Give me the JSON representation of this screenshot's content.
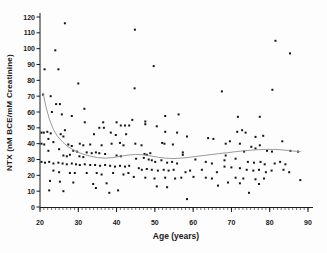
{
  "figure": {
    "background": "#fdfdfd",
    "point_color": "#141414",
    "curve_color": "#8f8f8f",
    "axis_color": "#1a1a1a",
    "tick_label_color": "#1a1a1a"
  },
  "chart_data": {
    "type": "scatter",
    "title": "",
    "xlabel": "Age (years)",
    "ylabel": "NTX (nM BCE/mM Creatinine)",
    "xlim": [
      20,
      90
    ],
    "ylim": [
      0,
      120
    ],
    "x_ticks": [
      20,
      30,
      40,
      50,
      60,
      70,
      80,
      90
    ],
    "y_ticks": [
      0,
      10,
      20,
      30,
      40,
      50,
      60,
      70,
      80,
      90,
      100,
      110,
      120
    ],
    "x_minor_tick_step": 1,
    "grid": false,
    "legend_position": "none",
    "series": [
      {
        "name": "individual NTX measurements",
        "type": "scatter",
        "marker": "square",
        "points": [
          [
            26.5,
            116
          ],
          [
            44.8,
            112
          ],
          [
            81.5,
            105
          ],
          [
            24.0,
            99
          ],
          [
            85.3,
            97
          ],
          [
            49.7,
            89
          ],
          [
            21.2,
            87
          ],
          [
            24.8,
            87
          ],
          [
            30.0,
            78
          ],
          [
            44.7,
            75
          ],
          [
            80.7,
            74
          ],
          [
            67.5,
            73
          ],
          [
            20.8,
            71
          ],
          [
            22.8,
            70
          ],
          [
            24.2,
            65
          ],
          [
            25.2,
            65
          ],
          [
            31.6,
            62
          ],
          [
            23.1,
            60
          ],
          [
            25.7,
            58.5
          ],
          [
            28.3,
            57.5
          ],
          [
            52.7,
            57.5
          ],
          [
            56.2,
            58.5
          ],
          [
            71.7,
            57
          ],
          [
            77.4,
            57
          ],
          [
            36.5,
            53.5
          ],
          [
            40.0,
            53.5
          ],
          [
            44.1,
            55
          ],
          [
            31.7,
            53.5
          ],
          [
            47.5,
            54
          ],
          [
            47.5,
            52.3
          ],
          [
            35.5,
            50
          ],
          [
            36.7,
            50
          ],
          [
            41.1,
            51.5
          ],
          [
            42.2,
            51.5
          ],
          [
            43.3,
            51.5
          ],
          [
            50.5,
            51
          ],
          [
            26.5,
            48.5
          ],
          [
            20.4,
            47
          ],
          [
            21.0,
            47
          ],
          [
            21.9,
            47.5
          ],
          [
            22.8,
            46.5
          ],
          [
            25.4,
            46
          ],
          [
            26.1,
            44.5
          ],
          [
            34.1,
            46
          ],
          [
            38.5,
            47
          ],
          [
            39.8,
            45.5
          ],
          [
            42.5,
            46
          ],
          [
            52.7,
            47.5
          ],
          [
            55.8,
            47
          ],
          [
            58.4,
            44.5
          ],
          [
            63.9,
            43.5
          ],
          [
            65.3,
            43
          ],
          [
            72.8,
            48.5
          ],
          [
            71.5,
            47.5
          ],
          [
            73.7,
            47
          ],
          [
            78.3,
            45
          ],
          [
            76.3,
            44.3
          ],
          [
            20.4,
            40
          ],
          [
            21.1,
            39.5
          ],
          [
            23.5,
            41
          ],
          [
            27.4,
            39.5
          ],
          [
            28.3,
            38.5
          ],
          [
            30.4,
            40
          ],
          [
            31.3,
            39
          ],
          [
            33.1,
            39.5
          ],
          [
            36.1,
            39
          ],
          [
            38.7,
            40
          ],
          [
            40.9,
            40.5
          ],
          [
            41.8,
            39
          ],
          [
            44.9,
            40
          ],
          [
            46.5,
            39
          ],
          [
            51.9,
            40.5
          ],
          [
            52.5,
            40
          ],
          [
            54.7,
            39.5
          ],
          [
            69.6,
            41.5
          ],
          [
            68.5,
            40
          ],
          [
            72.2,
            40
          ],
          [
            83.3,
            41.5
          ],
          [
            22.2,
            43
          ],
          [
            25.0,
            36.5
          ],
          [
            28.7,
            35.5
          ],
          [
            29.7,
            35
          ],
          [
            32.2,
            34.5
          ],
          [
            33.5,
            34
          ],
          [
            34.6,
            34.5
          ],
          [
            35.5,
            34
          ],
          [
            37.0,
            33.5
          ],
          [
            57.3,
            34.5
          ],
          [
            48.8,
            34
          ],
          [
            73.3,
            35
          ],
          [
            79.3,
            35.5
          ],
          [
            80.6,
            35
          ],
          [
            85.4,
            35.5
          ],
          [
            87.4,
            35
          ],
          [
            77.4,
            39
          ],
          [
            75.2,
            38
          ],
          [
            76.3,
            37
          ],
          [
            22.2,
            35.5
          ],
          [
            26.1,
            32.5
          ],
          [
            27.0,
            32
          ],
          [
            27.8,
            33
          ],
          [
            30.3,
            32
          ],
          [
            31.3,
            31.5
          ],
          [
            40.0,
            32.5
          ],
          [
            41.1,
            32
          ],
          [
            47.3,
            33.5
          ],
          [
            47.9,
            33
          ],
          [
            57.3,
            33
          ],
          [
            45.1,
            30.5
          ],
          [
            47.1,
            31
          ],
          [
            48.4,
            30
          ],
          [
            49.2,
            29.5
          ],
          [
            50.1,
            28.5
          ],
          [
            51.7,
            29.5
          ],
          [
            60.6,
            30
          ],
          [
            68.5,
            32.5
          ],
          [
            71.1,
            30.5
          ],
          [
            68.2,
            29.5
          ],
          [
            20.4,
            28.5
          ],
          [
            21.3,
            28
          ],
          [
            22.4,
            28.5
          ],
          [
            23.5,
            27.5
          ],
          [
            24.8,
            28
          ],
          [
            25.9,
            27.5
          ],
          [
            27.0,
            27
          ],
          [
            28.3,
            27.5
          ],
          [
            29.4,
            27
          ],
          [
            30.4,
            26.5
          ],
          [
            31.7,
            27
          ],
          [
            33.1,
            26.5
          ],
          [
            34.4,
            26.5
          ],
          [
            35.7,
            26
          ],
          [
            37.0,
            26.5
          ],
          [
            38.3,
            26
          ],
          [
            39.6,
            25.5
          ],
          [
            40.9,
            26
          ],
          [
            42.2,
            25.5
          ],
          [
            43.3,
            26
          ],
          [
            53.2,
            28
          ],
          [
            54.5,
            28.5
          ],
          [
            55.8,
            27.5
          ],
          [
            63.3,
            28.5
          ],
          [
            64.9,
            27.5
          ],
          [
            74.3,
            28.5
          ],
          [
            75.9,
            28
          ],
          [
            77.6,
            28.5
          ],
          [
            78.7,
            27
          ],
          [
            81.3,
            27.5
          ],
          [
            82.7,
            28.5
          ],
          [
            84.1,
            27
          ],
          [
            23.5,
            23
          ],
          [
            25.0,
            22
          ],
          [
            27.8,
            21.5
          ],
          [
            29.1,
            21.5
          ],
          [
            32.2,
            21.5
          ],
          [
            34.8,
            21.5
          ],
          [
            36.1,
            20.5
          ],
          [
            39.1,
            21.5
          ],
          [
            41.8,
            20.5
          ],
          [
            43.1,
            21.5
          ],
          [
            45.8,
            24.5
          ],
          [
            46.6,
            23.5
          ],
          [
            47.9,
            24
          ],
          [
            49.2,
            23.5
          ],
          [
            50.8,
            23
          ],
          [
            52.3,
            23.5
          ],
          [
            53.6,
            23
          ],
          [
            54.9,
            23.5
          ],
          [
            58.0,
            22
          ],
          [
            59.2,
            23
          ],
          [
            62.3,
            23.5
          ],
          [
            66.2,
            22
          ],
          [
            68.2,
            25.5
          ],
          [
            70.0,
            25
          ],
          [
            72.2,
            24.5
          ],
          [
            74.0,
            23.5
          ],
          [
            75.7,
            23
          ],
          [
            77.2,
            23.5
          ],
          [
            79.0,
            22
          ],
          [
            80.5,
            23
          ],
          [
            83.6,
            23.5
          ],
          [
            85.1,
            22
          ],
          [
            22.6,
            16.5
          ],
          [
            25.2,
            16
          ],
          [
            28.7,
            15.5
          ],
          [
            33.9,
            14.5
          ],
          [
            37.4,
            15
          ],
          [
            44.5,
            19
          ],
          [
            47.5,
            18.5
          ],
          [
            49.9,
            18
          ],
          [
            52.7,
            18.5
          ],
          [
            55.3,
            18
          ],
          [
            56.9,
            18.5
          ],
          [
            60.1,
            19
          ],
          [
            63.3,
            18.5
          ],
          [
            64.9,
            18
          ],
          [
            66.5,
            13.5
          ],
          [
            71.1,
            18.5
          ],
          [
            73.1,
            18
          ],
          [
            76.3,
            17.5
          ],
          [
            78.5,
            18
          ],
          [
            88.0,
            17
          ],
          [
            69.1,
            15.5
          ],
          [
            72.2,
            15
          ],
          [
            77.2,
            14.5
          ],
          [
            50.5,
            13
          ],
          [
            53.2,
            12.5
          ],
          [
            22.4,
            10.5
          ],
          [
            26.1,
            10
          ],
          [
            34.6,
            12
          ],
          [
            38.1,
            9
          ],
          [
            40.4,
            10.5
          ],
          [
            74.6,
            9
          ],
          [
            58.4,
            5
          ]
        ]
      },
      {
        "name": "smoothed trend curve",
        "type": "line",
        "points": [
          [
            20.8,
            72
          ],
          [
            21.6,
            63
          ],
          [
            22.5,
            55
          ],
          [
            23.5,
            49
          ],
          [
            24.6,
            44.5
          ],
          [
            26,
            40.8
          ],
          [
            27.5,
            37.8
          ],
          [
            29,
            35.6
          ],
          [
            31,
            33.6
          ],
          [
            33,
            32.2
          ],
          [
            35,
            31.2
          ],
          [
            37,
            30.8
          ],
          [
            39,
            31.2
          ],
          [
            41,
            32
          ],
          [
            43,
            32.8
          ],
          [
            45,
            33.2
          ],
          [
            47,
            33
          ],
          [
            49,
            32.2
          ],
          [
            51,
            31.4
          ],
          [
            53,
            30.8
          ],
          [
            55,
            30.6
          ],
          [
            57,
            30.9
          ],
          [
            59,
            31.4
          ],
          [
            61,
            32
          ],
          [
            63,
            32.6
          ],
          [
            65,
            33.2
          ],
          [
            67,
            33.8
          ],
          [
            69,
            34.3
          ],
          [
            71,
            34.9
          ],
          [
            73,
            35.4
          ],
          [
            75,
            35.9
          ],
          [
            77,
            36.2
          ],
          [
            79,
            36.4
          ],
          [
            81,
            36.4
          ],
          [
            83,
            36.1
          ],
          [
            85,
            35.6
          ],
          [
            87,
            35.1
          ],
          [
            88,
            34.9
          ]
        ]
      }
    ]
  }
}
